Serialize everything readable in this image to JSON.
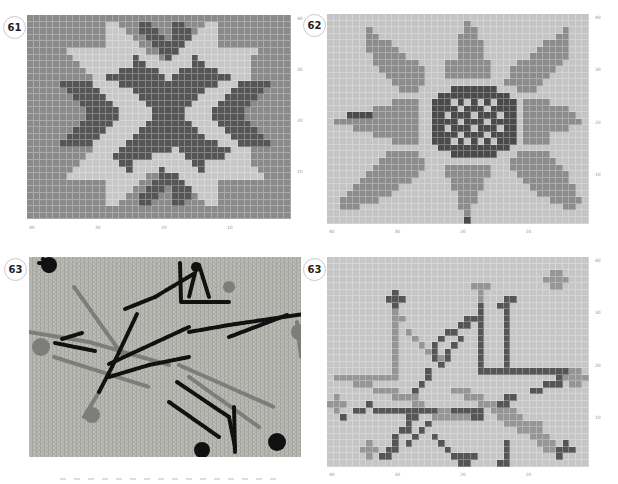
{
  "colors": {
    "c61_bg": "#8a8a8a",
    "c61_light": "#c8c8c8",
    "c61_dark": "#555555",
    "c62_bg": "#c4c4c4",
    "c62_mid": "#8c8c8c",
    "c62_dark": "#4a4a4a",
    "c63_bg": "#c6c6c6",
    "c63_dark": "#555555",
    "c63_mid": "#959595",
    "photo_bg": "#bdbdb8",
    "photo_black": "#111111",
    "photo_gray": "#7d7d7a"
  },
  "panels": [
    {
      "id": "61",
      "badge": "61",
      "type": "chart",
      "x": 27,
      "y": 15,
      "cols": 40,
      "rows": 31,
      "cell": 6.6,
      "x_ticks": [
        "40",
        "30",
        "20",
        "10"
      ],
      "y_ticks": [
        "40",
        "30",
        "20",
        "10"
      ]
    },
    {
      "id": "62",
      "badge": "62",
      "type": "chart",
      "x": 327,
      "y": 14,
      "cols": 40,
      "rows": 32,
      "cell": 6.55,
      "x_ticks": [
        "40",
        "30",
        "20",
        "10"
      ],
      "y_ticks": [
        "40",
        "30",
        "20",
        "10"
      ]
    },
    {
      "id": "63-photo",
      "badge": "63",
      "type": "photo",
      "x": 29,
      "y": 257,
      "w": 272,
      "h": 200
    },
    {
      "id": "63-chart",
      "badge": "63",
      "type": "chart",
      "x": 327,
      "y": 257,
      "cols": 40,
      "rows": 32,
      "cell": 6.55,
      "x_ticks": [
        "40",
        "30",
        "20",
        "10"
      ],
      "y_ticks": [
        "40",
        "30",
        "20",
        "10"
      ]
    }
  ],
  "chart61": {
    "legend": {
      "0": "background",
      "1": "light",
      "2": "dark"
    },
    "rows": [
      "0000000000000000000000000000000000000000",
      "0000000000001100022000220001100000000000",
      "0000000000001110022200222011100000000000",
      "0000000000001111002220222111100000000000",
      "0000000000001111100222221111100000000000",
      "0000001111111111110022211111111111100000",
      "0000000111111111211102111211111111000000",
      "0000000011111111221111111221111111000000",
      "0000000001111122222211122222211111000000",
      "0000000000112222222221222222222111000000",
      "0000022222111122222222222222211122222000",
      "0000002222211111222222222221111222220000",
      "0000000222221111122222222211112222200000",
      "0000000022222111112222222111122222000000",
      "0000000002222211111222221111222220000000",
      "0000000002222211111222221111222220000000",
      "0000000022222111112222222111122222000000",
      "0000000222221111122222222211112222200000",
      "0000002222211111222222222221111222220000",
      "0000022222111112222222222222211122222000",
      "0000000000111122222222122222222111000000",
      "0000000001111222222111112222221111000000",
      "0000000011111122111111111221111111000000",
      "0000000111111112111121111121111111100000",
      "0000001111111111110022211111111111110000",
      "0000000000001111100222221111100000000000",
      "0000000000001111002220222111100000000000",
      "0000000000001110022200222011100000000000",
      "0000000000001100022000220001100000000000",
      "0000000000000000000000000000000000000000",
      "0000000000000000000000000000000000000000"
    ]
  },
  "chart62": {
    "legend": {
      "0": "background",
      "1": "mid",
      "2": "dark"
    },
    "rows": [
      "0000000000000000000000000000000000000000",
      "0000000000000000000001000000000000000000",
      "0000001000000000000001100000000000001000",
      "0000001100000000000011100000000000011000",
      "0000001111000000000011110000000001111000",
      "0000001111100000000011110000000011111000",
      "0000000111110000000011110000000111111000",
      "0000000111111100001111111000011111110000",
      "0000000011111110001111111000111111100000",
      "0000000001111110001111111000111111000000",
      "0000000000111110000000000001111110000000",
      "0000000000011100000222222200011100000000",
      "0000000000000000022222222222000000000000",
      "0000000000111100222020202022201111000000",
      "0000000111111100222202220222201111111000",
      "0002222111111100220222022202201111111100",
      "0111111111111100222202220222201111111110",
      "0000111111111100220222022202201111111000",
      "0000000111111100222202220222201111000000",
      "0000000000111100222020202022201111000000",
      "0000000000000000022222222222000000000000",
      "0000000001111100000222222200011111000000",
      "0000000011111110000000000000111111100000",
      "0000000111111110001111111000111111110000",
      "0000001111111100001111111000011111111000",
      "0000011111111000000111110000001111111000",
      "0000111111100000000111110000000111111100",
      "0001111111000000000011100000000011111100",
      "0011111100000000000011100000000000111110",
      "0011100000000000000011000000000000001100",
      "0000000000000000000001000000000000000000",
      "0000000000000000000002000000000000000000"
    ]
  },
  "chart63": {
    "legend": {
      "0": "background",
      "1": "dark",
      "2": "mid"
    },
    "rows": [
      "0000000000000000000000000000000000000000",
      "0000000000000000000000000000000000000000",
      "0000000000000000000000000000000000220000",
      "0000000000000000000000000000000002222000",
      "0000000000000000000000222000000000220000",
      "0000000000100000000000020000000000000000",
      "0000000001110000000000020001100000000000",
      "0000000000100000000000010011000000000000",
      "0000000000200000000000010001000000000000",
      "0000000000220000000001110001000000000000",
      "0000000000200000000011010001000000000000",
      "0000000000202000001100010001000000000000",
      "0000000000200200010010010001000000000000",
      "0000000000200020100100010001000000000000",
      "0000000000200002101000010001000000000000",
      "0000000000200000121000010001000000000000",
      "0000000000200000010000010001000000000000",
      "0000000000200001000000011111111111111220",
      "0222222222200001000000000000000000012222",
      "0000222000000010000000000000000001110220",
      "0000000222200100000222000000000110000000",
      "0200000000222200000002220001100000000000",
      "2220001000000220000000022211000000000000",
      "0200110111111111122111110222200000000000",
      "0010000000001100222222110022220000000000",
      "0000000000001001000000000002222220000000",
      "0000000000011010000000000000022220000000",
      "0000000000100100100000000000000222000000",
      "0000002000101000010000000001000022201000",
      "0000022201100000001000000001000002211100",
      "0000002011000000000111100001000000010000",
      "0000000000000000000011000011000000000000"
    ]
  },
  "photo63": {
    "black_strokes": [
      "M14,2 L20,14",
      "M10,6 l10,0",
      "M151,6 L152,45 L200,45",
      "M170,8 L180,40",
      "M126,40 L166,16 L160,40",
      "M96,52 L126,40",
      "M108,57 L83,110 L70,135",
      "M26,86 L66,94",
      "M33,82 L53,76",
      "M80,107 L160,70",
      "M160,75 L200,68 L275,57",
      "M200,80 L258,58",
      "M80,120 L120,108 L160,100",
      "M148,125 L200,160 L206,190",
      "M205,150 L206,195",
      "M140,145 L190,180"
    ],
    "gray_strokes": [
      "M45,30 L95,100",
      "M0,75 L60,85 L140,108",
      "M25,100 L120,130",
      "M150,108 L245,150",
      "M160,120 L230,170",
      "M70,135 L55,160",
      "M268,65 L272,100"
    ],
    "black_blobs": [
      [
        20,
        8,
        8
      ],
      [
        248,
        185,
        9
      ],
      [
        173,
        193,
        8
      ],
      [
        167,
        10,
        5
      ]
    ],
    "gray_blobs": [
      [
        12,
        90,
        9
      ],
      [
        63,
        158,
        8
      ],
      [
        270,
        75,
        8
      ],
      [
        200,
        30,
        6
      ]
    ]
  }
}
